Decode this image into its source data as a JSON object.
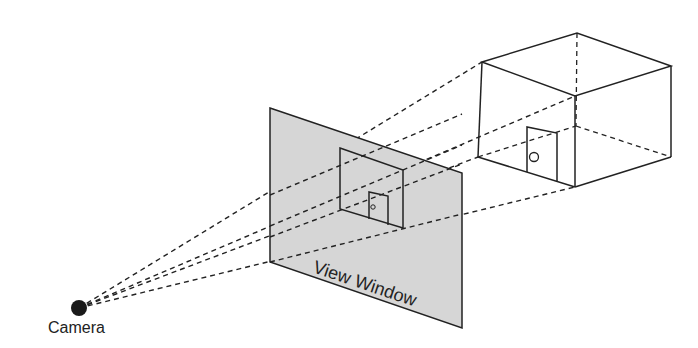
{
  "diagram": {
    "labels": {
      "camera": "Camera",
      "view_window": "View Window"
    },
    "colors": {
      "stroke": "#222222",
      "plane_fill": "#d6d6d6",
      "camera_fill": "#1a1a1a"
    },
    "nodes": [
      {
        "id": "camera",
        "shape": "dot",
        "label": "Camera"
      },
      {
        "id": "view-window",
        "shape": "plane",
        "label": "View Window"
      },
      {
        "id": "scene-box",
        "shape": "cube-room-with-door"
      }
    ],
    "edges": [
      {
        "from": "camera",
        "to": "scene-box",
        "style": "dashed",
        "note": "projection rays through view window"
      }
    ]
  }
}
